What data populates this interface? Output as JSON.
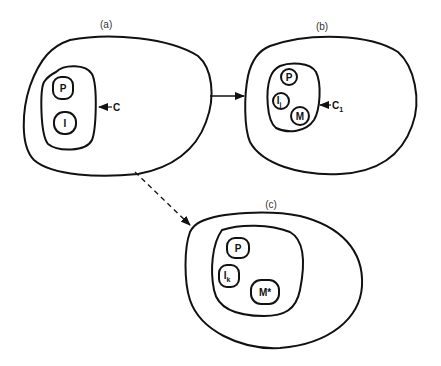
{
  "diagram": {
    "panels": [
      {
        "id": "a",
        "label": "(a)",
        "container_label": "C",
        "nodes": [
          {
            "id": "P",
            "label": "P",
            "subscript": ""
          },
          {
            "id": "I",
            "label": "I",
            "subscript": ""
          }
        ]
      },
      {
        "id": "b",
        "label": "(b)",
        "container_label": "C",
        "container_subscript": "1",
        "nodes": [
          {
            "id": "P",
            "label": "P",
            "subscript": ""
          },
          {
            "id": "Ij",
            "label": "I",
            "subscript": "j"
          },
          {
            "id": "M",
            "label": "M",
            "subscript": ""
          }
        ]
      },
      {
        "id": "c",
        "label": "(c)",
        "container_label": "",
        "nodes": [
          {
            "id": "P",
            "label": "P",
            "subscript": ""
          },
          {
            "id": "Ik",
            "label": "I",
            "subscript": "k"
          },
          {
            "id": "Mstar",
            "label": "M*",
            "subscript": ""
          }
        ]
      }
    ],
    "edges": [
      {
        "from": "a",
        "to": "b",
        "style": "solid"
      },
      {
        "from": "a",
        "to": "c",
        "style": "dashed"
      }
    ],
    "colors": {
      "stroke": "#111111",
      "background": "#ffffff"
    }
  }
}
